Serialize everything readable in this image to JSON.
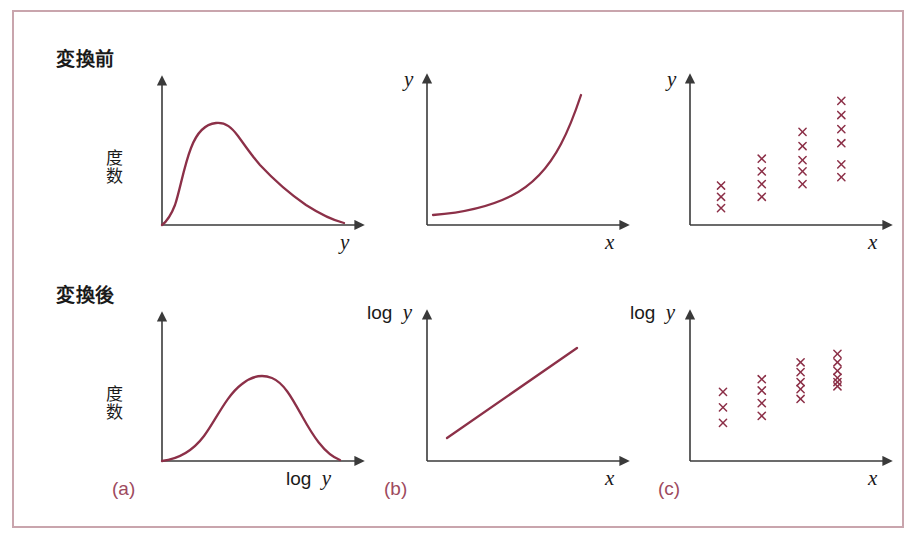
{
  "figure": {
    "row_labels": {
      "before": "変換前",
      "after": "変換後"
    },
    "captions": {
      "a": "(a)",
      "b": "(b)",
      "c": "(c)"
    },
    "colors": {
      "curve": "#8c3048",
      "axis": "#3a3a3a",
      "frame": "#c9a5ad",
      "caption": "#9e4a5e",
      "marker": "#8c3048"
    }
  },
  "chart_data": [
    {
      "id": "panel-a-top",
      "type": "line",
      "title": "変換前 (a)",
      "xlabel": "y",
      "ylabel": "度数",
      "ylabel_parts": [
        "度",
        "数"
      ],
      "description": "right-skewed (log-normal) frequency distribution of y",
      "grid": false,
      "legend": null,
      "xlim": [
        0,
        1
      ],
      "ylim": [
        0,
        1
      ],
      "x": [
        0.0,
        0.04,
        0.08,
        0.12,
        0.16,
        0.2,
        0.24,
        0.28,
        0.32,
        0.36,
        0.4,
        0.48,
        0.56,
        0.64,
        0.72,
        0.8,
        0.88,
        0.96,
        1.0
      ],
      "y": [
        0.0,
        0.02,
        0.06,
        0.16,
        0.36,
        0.6,
        0.77,
        0.86,
        0.88,
        0.86,
        0.83,
        0.75,
        0.66,
        0.57,
        0.47,
        0.38,
        0.29,
        0.21,
        0.17
      ]
    },
    {
      "id": "panel-b-top",
      "type": "line",
      "title": "変換前 (b)",
      "xlabel": "x",
      "ylabel": "y",
      "description": "exponential growth curve of y against x",
      "grid": false,
      "legend": null,
      "xlim": [
        0,
        1
      ],
      "ylim": [
        0,
        1
      ],
      "x": [
        0.06,
        0.15,
        0.25,
        0.35,
        0.45,
        0.55,
        0.65,
        0.75,
        0.82,
        0.88
      ],
      "y": [
        0.04,
        0.06,
        0.09,
        0.13,
        0.19,
        0.28,
        0.41,
        0.6,
        0.76,
        0.93
      ]
    },
    {
      "id": "panel-c-top",
      "type": "scatter",
      "title": "変換前 (c)",
      "xlabel": "x",
      "ylabel": "y",
      "description": "scatter showing increasing spread (heteroscedasticity) as x increases",
      "grid": false,
      "legend": null,
      "marker": "x",
      "xlim": [
        0,
        1
      ],
      "ylim": [
        0,
        1
      ],
      "groups": [
        {
          "x": 0.16,
          "count": 3,
          "y": [
            0.28,
            0.2,
            0.12
          ]
        },
        {
          "x": 0.37,
          "count": 4,
          "y": [
            0.47,
            0.38,
            0.29,
            0.2
          ]
        },
        {
          "x": 0.58,
          "count": 5,
          "y": [
            0.66,
            0.56,
            0.46,
            0.38,
            0.29
          ]
        },
        {
          "x": 0.78,
          "count": 6,
          "y": [
            0.88,
            0.78,
            0.68,
            0.58,
            0.43,
            0.34
          ]
        }
      ]
    },
    {
      "id": "panel-a-bottom",
      "type": "line",
      "title": "変換後 (a)",
      "xlabel": "log y",
      "ylabel": "度数",
      "ylabel_parts": [
        "度",
        "数"
      ],
      "description": "symmetric bell-shaped frequency distribution of log y",
      "grid": false,
      "legend": null,
      "xlim": [
        0,
        1
      ],
      "ylim": [
        0,
        1
      ],
      "x": [
        0.0,
        0.06,
        0.12,
        0.18,
        0.24,
        0.3,
        0.36,
        0.42,
        0.48,
        0.54,
        0.6,
        0.66,
        0.72,
        0.78,
        0.84,
        0.9,
        0.96,
        1.0
      ],
      "y": [
        0.0,
        0.02,
        0.06,
        0.14,
        0.27,
        0.45,
        0.63,
        0.77,
        0.84,
        0.84,
        0.79,
        0.69,
        0.55,
        0.39,
        0.24,
        0.11,
        0.03,
        0.0
      ]
    },
    {
      "id": "panel-b-bottom",
      "type": "line",
      "title": "変換後 (b)",
      "xlabel": "x",
      "ylabel": "log y",
      "description": "straight line relationship between log y and x",
      "grid": false,
      "legend": null,
      "xlim": [
        0,
        1
      ],
      "ylim": [
        0,
        1
      ],
      "x": [
        0.1,
        0.85
      ],
      "y": [
        0.12,
        0.78
      ]
    },
    {
      "id": "panel-c-bottom",
      "type": "scatter",
      "title": "変換後 (c)",
      "xlabel": "x",
      "ylabel": "log y",
      "description": "scatter with constant spread (homoscedasticity) and rising mean",
      "grid": false,
      "legend": null,
      "marker": "x",
      "xlim": [
        0,
        1
      ],
      "ylim": [
        0,
        1
      ],
      "groups": [
        {
          "x": 0.17,
          "count": 3,
          "y": [
            0.49,
            0.38,
            0.27
          ]
        },
        {
          "x": 0.37,
          "count": 4,
          "y": [
            0.58,
            0.5,
            0.41,
            0.32
          ]
        },
        {
          "x": 0.57,
          "count": 5,
          "y": [
            0.7,
            0.63,
            0.56,
            0.51,
            0.44
          ]
        },
        {
          "x": 0.76,
          "count": 6,
          "y": [
            0.76,
            0.7,
            0.64,
            0.59,
            0.56,
            0.53
          ]
        }
      ]
    }
  ]
}
